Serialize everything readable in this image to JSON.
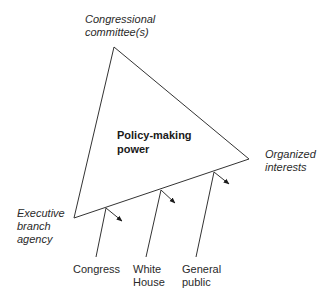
{
  "diagram": {
    "type": "iron-triangle-power-diagram",
    "center_label": {
      "line1": "Policy-making",
      "line2": "power"
    },
    "vertices": {
      "top": {
        "line1": "Congressional",
        "line2": "committee(s)"
      },
      "right": {
        "line1": "Organized",
        "line2": "interests"
      },
      "left": {
        "line1": "Executive",
        "line2": "branch",
        "line3": "agency"
      }
    },
    "external_influences": [
      {
        "line1": "Congress",
        "line2": ""
      },
      {
        "line1": "White",
        "line2": "House"
      },
      {
        "line1": "General",
        "line2": "public"
      }
    ],
    "colors": {
      "line": "#333333",
      "text": "#2a2a2a",
      "background": "#ffffff"
    }
  }
}
